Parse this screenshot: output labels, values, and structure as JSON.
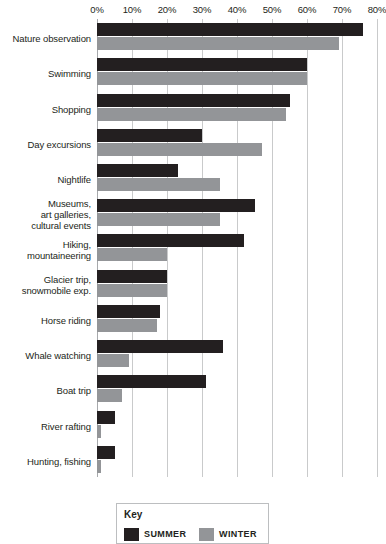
{
  "chart_data": {
    "type": "bar",
    "orientation": "horizontal",
    "title": "",
    "xlabel": "",
    "ylabel": "",
    "xlim": [
      0,
      80
    ],
    "xtick_labels": [
      "0%",
      "10%",
      "20%",
      "30%",
      "40%",
      "50%",
      "60%",
      "70%",
      "80%"
    ],
    "xticks": [
      0,
      10,
      20,
      30,
      40,
      50,
      60,
      70,
      80
    ],
    "xtick_suffix": "%",
    "grid": true,
    "legend_position": "bottom",
    "categories": [
      "Nature observation",
      "Swimming",
      "Shopping",
      "Day excursions",
      "Nightlife",
      "Museums,\nart galleries,\ncultural events",
      "Hiking,\nmountaineering",
      "Glacier trip,\nsnowmobile exp.",
      "Horse riding",
      "Whale watching",
      "Boat trip",
      "River rafting",
      "Hunting, fishing"
    ],
    "series": [
      {
        "name": "SUMMER",
        "color": "#231f20",
        "values": [
          76,
          60,
          55,
          30,
          23,
          45,
          42,
          20,
          18,
          36,
          31,
          5,
          5
        ]
      },
      {
        "name": "WINTER",
        "color": "#939598",
        "values": [
          69,
          60,
          54,
          47,
          35,
          35,
          20,
          20,
          17,
          9,
          7,
          1,
          1
        ]
      }
    ]
  },
  "legend": {
    "title": "Key",
    "entries": [
      {
        "label": "SUMMER",
        "color": "#231f20"
      },
      {
        "label": "WINTER",
        "color": "#939598"
      }
    ]
  },
  "colors": {
    "summer": "#231f20",
    "winter": "#939598",
    "gridline": "#c9cacb",
    "background": "#ffffff",
    "text": "#231f20"
  }
}
